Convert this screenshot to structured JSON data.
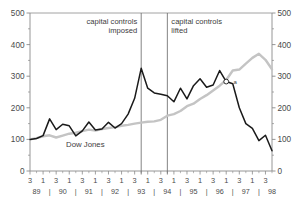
{
  "chart_data": {
    "type": "line",
    "title": "",
    "xlabel": "",
    "ylabel": "",
    "ylim": [
      0,
      500
    ],
    "y_ticks": [
      0,
      100,
      200,
      300,
      400,
      500
    ],
    "y_ticks_right": [
      0,
      100,
      200,
      300,
      400,
      500
    ],
    "grid": false,
    "legend_position": "inline-annotation",
    "x": [
      "89Q3",
      "89Q4",
      "90Q1",
      "90Q2",
      "90Q3",
      "90Q4",
      "91Q1",
      "91Q2",
      "91Q3",
      "91Q4",
      "92Q1",
      "92Q2",
      "92Q3",
      "92Q4",
      "93Q1",
      "93Q2",
      "93Q3",
      "93Q4",
      "94Q1",
      "94Q2",
      "94Q3",
      "94Q4",
      "95Q1",
      "95Q2",
      "95Q3",
      "95Q4",
      "96Q1",
      "96Q2",
      "96Q3",
      "96Q4",
      "97Q1",
      "97Q2",
      "97Q3",
      "97Q4",
      "98Q1",
      "98Q2",
      "98Q3",
      "98Q4"
    ],
    "quarter_ticks": [
      "3",
      "1",
      "3",
      "1",
      "3",
      "1",
      "3",
      "1",
      "3",
      "1",
      "3",
      "1",
      "3",
      "1",
      "3",
      "1",
      "3",
      "1",
      "3",
      "1"
    ],
    "year_ticks": [
      "89",
      "90",
      "91",
      "92",
      "93",
      "94",
      "95",
      "96",
      "97",
      "98"
    ],
    "series": [
      {
        "name": "Stock index",
        "color": "#1a1a1a",
        "values": [
          100,
          103,
          112,
          165,
          131,
          148,
          143,
          111,
          127,
          155,
          130,
          133,
          154,
          136,
          150,
          180,
          230,
          325,
          262,
          247,
          243,
          238,
          219,
          262,
          228,
          270,
          292,
          265,
          272,
          318,
          283,
          276,
          200,
          150,
          135,
          96,
          113,
          64
        ]
      },
      {
        "name": "Dow Jones",
        "color": "#c4c4c4",
        "values": [
          100,
          104,
          110,
          113,
          106,
          112,
          118,
          121,
          126,
          131,
          128,
          133,
          136,
          139,
          143,
          146,
          150,
          153,
          156,
          157,
          162,
          175,
          180,
          190,
          205,
          213,
          228,
          240,
          255,
          270,
          288,
          318,
          321,
          340,
          358,
          371,
          352,
          322
        ]
      }
    ],
    "annotations": [
      {
        "name": "capital-controls-imposed",
        "lines": [
          "capital controls",
          "imposed"
        ],
        "align": "right",
        "x_position": "93Q4"
      },
      {
        "name": "capital-controls-lifted",
        "lines": [
          "capital controls",
          "lifted"
        ],
        "align": "left",
        "x_position": "94Q4"
      }
    ],
    "series_inline_label": "Dow Jones",
    "point_marker": {
      "label": "a",
      "value": 283,
      "x_position": "97Q1",
      "style": "open-circle"
    },
    "vertical_lines": [
      "93Q4",
      "94Q4"
    ]
  },
  "colors": {
    "axis": "#8a8a8a",
    "text": "#4a4a4a",
    "series_primary": "#1a1a1a",
    "series_secondary": "#c4c4c4",
    "background": "#ffffff"
  }
}
